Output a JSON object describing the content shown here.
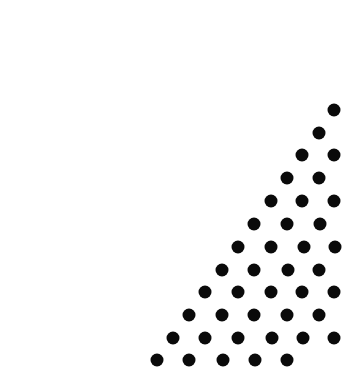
{
  "canvas": {
    "width": 336,
    "height": 365,
    "background": "#ffffff",
    "dot_color": "#0a0a0a",
    "dot_diameter": 13
  },
  "pattern": {
    "type": "triangular-dot-grid",
    "rows": [
      {
        "y": 110,
        "x": [
          334
        ]
      },
      {
        "y": 133,
        "x": [
          319
        ]
      },
      {
        "y": 155,
        "x": [
          302,
          334
        ]
      },
      {
        "y": 178,
        "x": [
          287,
          319
        ]
      },
      {
        "y": 201,
        "x": [
          271,
          302,
          334
        ]
      },
      {
        "y": 224,
        "x": [
          254,
          287,
          320
        ]
      },
      {
        "y": 247,
        "x": [
          238,
          271,
          304,
          335
        ]
      },
      {
        "y": 270,
        "x": [
          222,
          254,
          288,
          319
        ]
      },
      {
        "y": 292,
        "x": [
          205,
          238,
          271,
          302,
          334
        ]
      },
      {
        "y": 315,
        "x": [
          189,
          222,
          254,
          287,
          319
        ]
      },
      {
        "y": 338,
        "x": [
          173,
          205,
          238,
          272,
          303,
          334
        ]
      },
      {
        "y": 360,
        "x": [
          157,
          189,
          223,
          255,
          287
        ]
      }
    ]
  }
}
